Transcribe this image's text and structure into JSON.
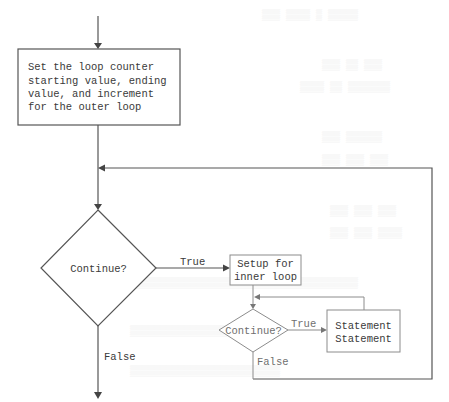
{
  "diagram": {
    "type": "flowchart",
    "outer_setup_box": {
      "lines": [
        "Set the loop counter",
        "starting value, ending",
        "value, and increment",
        "for the outer loop"
      ]
    },
    "outer_decision": {
      "label": "Continue?"
    },
    "outer_true_label": "True",
    "outer_false_label": "False",
    "inner_setup_box": {
      "lines": [
        "Setup for",
        "inner loop"
      ]
    },
    "inner_decision": {
      "label": "Continue?"
    },
    "inner_true_label": "True",
    "inner_false_label": "False",
    "statement_box": {
      "lines": [
        "Statement",
        "Statement"
      ]
    },
    "colors": {
      "outer_stroke": "#555555",
      "inner_stroke": "#8c8c8c",
      "text_dark": "#3a3a3a",
      "text_light": "#6f6f6f",
      "background": "#ffffff"
    }
  }
}
